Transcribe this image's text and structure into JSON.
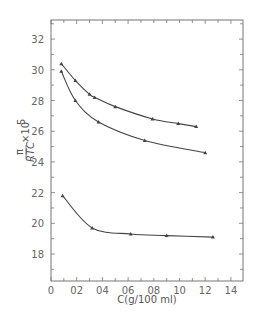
{
  "chart_data": {
    "type": "line",
    "title": "",
    "xlabel": "C(g/100 ml)",
    "ylabel": "π/RTC × 10^5",
    "ylabel_parts": {
      "main": "π",
      "denominator": "RTC",
      "factor": "×10",
      "exponent": "5"
    },
    "xlim": [
      0,
      1.5
    ],
    "ylim": [
      1.62,
      3.32
    ],
    "x_ticks": [
      0,
      0.2,
      0.4,
      0.6,
      0.8,
      1.0,
      1.2,
      1.4
    ],
    "x_tick_labels": [
      "0",
      "02",
      "04",
      "06",
      "08",
      "10",
      "12",
      "14"
    ],
    "y_ticks": [
      1.8,
      2.0,
      2.2,
      2.4,
      2.6,
      2.8,
      3.0,
      3.2
    ],
    "y_tick_labels": [
      "18",
      "20",
      "22",
      "24",
      "26",
      "28",
      "30",
      "32"
    ],
    "grid": false,
    "legend": null,
    "series": [
      {
        "name": "upper",
        "x": [
          0.08,
          0.19,
          0.3,
          0.34,
          0.5,
          0.79,
          0.99,
          1.13
        ],
        "y": [
          3.04,
          2.93,
          2.84,
          2.82,
          2.76,
          2.68,
          2.65,
          2.63
        ]
      },
      {
        "name": "middle",
        "x": [
          0.08,
          0.19,
          0.37,
          0.73,
          1.2
        ],
        "y": [
          2.99,
          2.8,
          2.66,
          2.54,
          2.46
        ]
      },
      {
        "name": "lower",
        "x": [
          0.09,
          0.32,
          0.62,
          0.9,
          1.26
        ],
        "y": [
          2.18,
          1.97,
          1.93,
          1.92,
          1.91
        ]
      }
    ],
    "colors": {
      "axis": "#777777",
      "line": "#444444",
      "label": "#666666"
    }
  }
}
